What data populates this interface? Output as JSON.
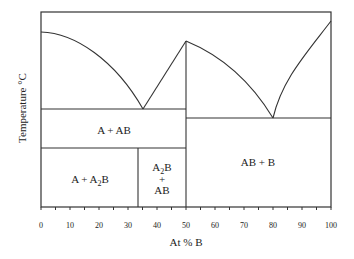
{
  "chart_data": {
    "type": "phase-diagram",
    "title": "",
    "xlabel": "At % B",
    "ylabel": "Temperature °C",
    "xlim": [
      0,
      100
    ],
    "x_ticks": [
      "0",
      "10",
      "20",
      "30",
      "40",
      "50",
      "60",
      "70",
      "80",
      "90",
      "100"
    ],
    "minor_tick_step": 5,
    "grid": false,
    "compounds": [
      {
        "name": "A2B",
        "at_pct_B": 33.3
      },
      {
        "name": "AB",
        "at_pct_B": 50
      }
    ],
    "eutectics": [
      {
        "at_pct_B": 35,
        "phases": "A + AB"
      },
      {
        "at_pct_B": 80,
        "phases": "AB + B"
      }
    ],
    "regions": [
      {
        "id": "r1",
        "label": "A + AB"
      },
      {
        "id": "r2",
        "label_main": "A + A",
        "label_sub": "2",
        "label_tail": "B"
      },
      {
        "id": "r3",
        "line1_main": "A",
        "line1_sub": "2",
        "line1_tail": "B",
        "line2": "+",
        "line3": "AB"
      },
      {
        "id": "r4",
        "label": "AB + B"
      }
    ],
    "liquidus_points_pct_B": [
      0,
      35,
      50,
      80,
      100
    ],
    "liquidus_relative_height": [
      0.92,
      0.5,
      0.85,
      0.46,
      0.97
    ]
  },
  "colors": {
    "line": "#333333",
    "text": "#222222",
    "background": "#ffffff"
  }
}
